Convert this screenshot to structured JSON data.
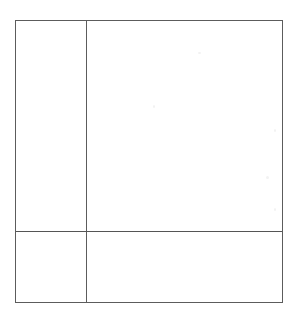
{
  "document": {
    "type": "scanned-document",
    "title": "",
    "page_background": "#ffffff",
    "has_text": false,
    "notes": ""
  },
  "form_grid": {
    "name": "blank-ruled-table",
    "line_color": "#5c5c5c",
    "line_width_px": 1,
    "fill_color": "#ffffff",
    "bounds": {
      "left": 15,
      "top": 20,
      "width": 268,
      "height": 283
    },
    "columns": [
      {
        "id": "col-narrow",
        "label": "",
        "width_px": 70
      },
      {
        "id": "col-wide",
        "label": "",
        "width_px": 196
      }
    ],
    "rows": [
      {
        "id": "row-body",
        "label": "",
        "height_px": 210
      },
      {
        "id": "row-footer",
        "label": "",
        "height_px": 71
      }
    ],
    "rules": {
      "vertical_divider_x": 85,
      "horizontal_divider_y": 231
    },
    "cells": [
      {
        "id": "cell-top-left",
        "row": "row-body",
        "column": "col-narrow",
        "text": ""
      },
      {
        "id": "cell-top-right",
        "row": "row-body",
        "column": "col-wide",
        "text": ""
      },
      {
        "id": "cell-bottom-left",
        "row": "row-footer",
        "column": "col-narrow",
        "text": ""
      },
      {
        "id": "cell-bottom-right",
        "row": "row-footer",
        "column": "col-wide",
        "text": ""
      }
    ]
  },
  "artifacts": {
    "count": 5,
    "color": "#f2f2f2",
    "description": ""
  }
}
